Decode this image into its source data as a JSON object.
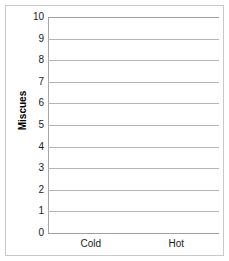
{
  "chart_data": {
    "type": "bar",
    "title": "",
    "xlabel": "",
    "ylabel": "Miscues",
    "categories": [
      "Cold",
      "Hot"
    ],
    "values": [
      null,
      null
    ],
    "series": [
      {
        "name": "",
        "values": [
          null,
          null
        ]
      }
    ],
    "ylim": [
      0,
      10
    ],
    "ytick_labels": [
      "0",
      "1",
      "2",
      "3",
      "4",
      "5",
      "6",
      "7",
      "8",
      "9",
      "10"
    ],
    "ytick_values": [
      0,
      1,
      2,
      3,
      4,
      5,
      6,
      7,
      8,
      9,
      10
    ],
    "grid": "horizontal",
    "legend": "none",
    "note": "empty plot area — no bars or data marks drawn",
    "colors": {
      "gridline": "#b5b5b5",
      "axis": "#a8a8a8",
      "frame": "#c9c9c9",
      "text": "#1a1a1a",
      "background": "#ffffff"
    }
  }
}
